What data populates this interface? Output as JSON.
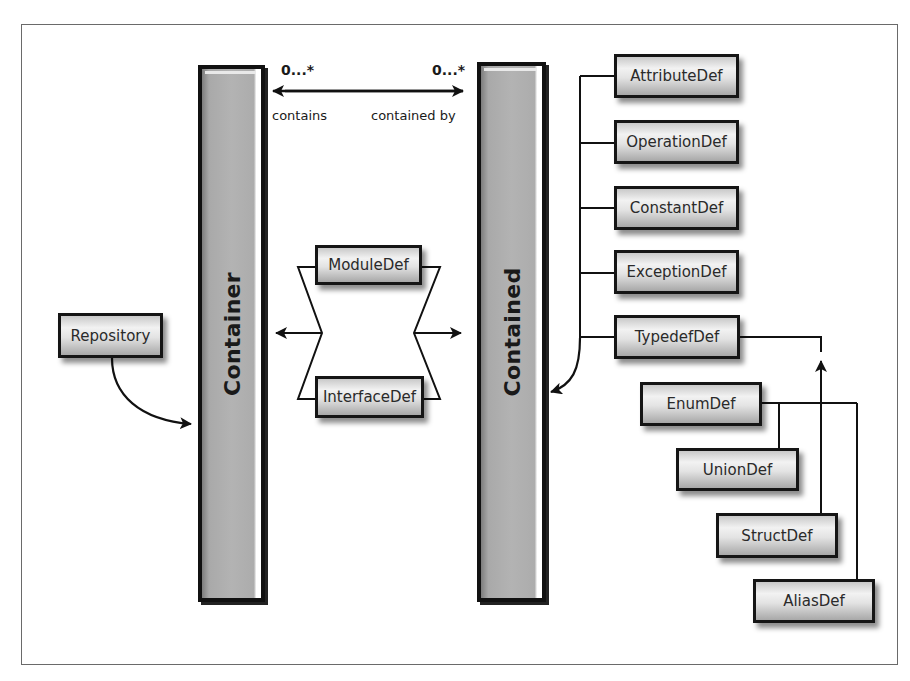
{
  "diagram": {
    "title": "",
    "columns": {
      "container": {
        "label": "Container"
      },
      "contained": {
        "label": "Contained"
      }
    },
    "association": {
      "left_multiplicity": "0...*",
      "right_multiplicity": "0...*",
      "left_role": "contains",
      "right_role": "contained by"
    },
    "nodes": {
      "repository": "Repository",
      "module_def": "ModuleDef",
      "interface_def": "InterfaceDef",
      "attribute_def": "AttributeDef",
      "operation_def": "OperationDef",
      "constant_def": "ConstantDef",
      "exception_def": "ExceptionDef",
      "typedef_def": "TypedefDef",
      "enum_def": "EnumDef",
      "union_def": "UnionDef",
      "struct_def": "StructDef",
      "alias_def": "AliasDef"
    },
    "relationships": [
      {
        "from": "Repository",
        "to": "Container",
        "type": "is-a"
      },
      {
        "from": "ModuleDef",
        "to": "Container",
        "type": "is-a"
      },
      {
        "from": "InterfaceDef",
        "to": "Container",
        "type": "is-a"
      },
      {
        "from": "ModuleDef",
        "to": "Contained",
        "type": "is-a"
      },
      {
        "from": "InterfaceDef",
        "to": "Contained",
        "type": "is-a"
      },
      {
        "from": "AttributeDef",
        "to": "Contained",
        "type": "is-a"
      },
      {
        "from": "OperationDef",
        "to": "Contained",
        "type": "is-a"
      },
      {
        "from": "ConstantDef",
        "to": "Contained",
        "type": "is-a"
      },
      {
        "from": "ExceptionDef",
        "to": "Contained",
        "type": "is-a"
      },
      {
        "from": "TypedefDef",
        "to": "Contained",
        "type": "is-a"
      },
      {
        "from": "EnumDef",
        "to": "TypedefDef",
        "type": "is-a"
      },
      {
        "from": "UnionDef",
        "to": "TypedefDef",
        "type": "is-a"
      },
      {
        "from": "StructDef",
        "to": "TypedefDef",
        "type": "is-a"
      },
      {
        "from": "AliasDef",
        "to": "TypedefDef",
        "type": "is-a"
      },
      {
        "from": "Container",
        "to": "Contained",
        "type": "association",
        "label": "contains / contained by",
        "multiplicity": "0...* / 0...*"
      }
    ],
    "colors": {
      "line": "#111111",
      "column_fill": "#b3b3b3",
      "node_border": "#151515",
      "frame_border": "#6a6a6a",
      "background": "#ffffff"
    }
  }
}
